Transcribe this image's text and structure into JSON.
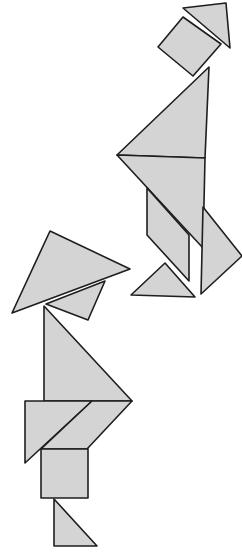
{
  "image": {
    "width": 242,
    "height": 556,
    "background": "#ffffff",
    "piece_fill": "#d4d4d4",
    "piece_stroke": "#1e1e1e",
    "description": "Two tangram figures made of gray polygons with dark outlines"
  },
  "figures": [
    {
      "name": "upper-figure",
      "pieces": [
        {
          "name": "head-triangle",
          "shape": "triangle",
          "points": "183,8 226,3 230,48"
        },
        {
          "name": "head-square",
          "shape": "square",
          "points": "158,47 183,17 221,44 193,76"
        },
        {
          "name": "upper-large-triangle",
          "shape": "triangle",
          "points": "117,155 209,67 205,158"
        },
        {
          "name": "lower-large-triangle",
          "shape": "triangle",
          "points": "117,155 205,158 203,248"
        },
        {
          "name": "parallelogram",
          "shape": "parallelogram",
          "points": "147,188 147,235 189,281 189,235"
        },
        {
          "name": "right-medium-triangle",
          "shape": "triangle",
          "points": "203,207 242,256 201,294"
        },
        {
          "name": "foot-small-triangle",
          "shape": "triangle",
          "points": "131,295 165,263 195,297"
        }
      ]
    },
    {
      "name": "lower-figure",
      "pieces": [
        {
          "name": "hat-large-triangle",
          "shape": "triangle",
          "points": "12,313 50,231 130,269"
        },
        {
          "name": "hat-square",
          "shape": "square",
          "points": "46,304 105,281 88,320"
        },
        {
          "name": "body-large-triangle",
          "shape": "triangle",
          "points": "44,306 44,401 132,401"
        },
        {
          "name": "skirt-medium-triangle",
          "shape": "triangle",
          "points": "25,401 92,401 25,463"
        },
        {
          "name": "skirt-parallelogram",
          "shape": "parallelogram",
          "points": "92,401 132,401 87,449 41,449"
        },
        {
          "name": "leg-square",
          "shape": "square",
          "points": "41,449 88,449 88,498 41,498"
        },
        {
          "name": "foot-small-triangle",
          "shape": "triangle",
          "points": "54,499 54,546 97,546"
        }
      ]
    }
  ]
}
